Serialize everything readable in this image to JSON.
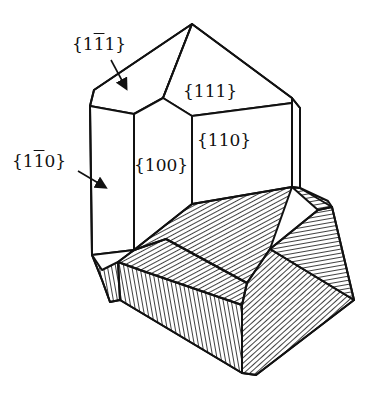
{
  "figure": {
    "type": "crystal-habit-diagram",
    "labels": [
      {
        "id": "face-1-1bar-1",
        "text_pre": "{1",
        "text_bar": "1",
        "text_post": "1}",
        "x": 72,
        "y": 36
      },
      {
        "id": "face-111",
        "text_pre": "{111}",
        "text_bar": "",
        "text_post": "",
        "x": 183,
        "y": 83
      },
      {
        "id": "face-110",
        "text_pre": "{110}",
        "text_bar": "",
        "text_post": "",
        "x": 197,
        "y": 132
      },
      {
        "id": "face-100",
        "text_pre": "{100}",
        "text_bar": "",
        "text_post": "",
        "x": 134,
        "y": 157
      },
      {
        "id": "face-1-1bar-0",
        "text_pre": "{1",
        "text_bar": "1",
        "text_post": "0}",
        "x": 12,
        "y": 153
      }
    ],
    "arrows": [
      {
        "target": "face-1-1bar-1",
        "from": [
          111,
          60
        ],
        "to": [
          127,
          90
        ]
      },
      {
        "target": "face-1-1bar-0",
        "from": [
          78,
          171
        ],
        "to": [
          107,
          188
        ]
      }
    ],
    "colors": {
      "line": "#111111",
      "background": "#ffffff"
    }
  }
}
